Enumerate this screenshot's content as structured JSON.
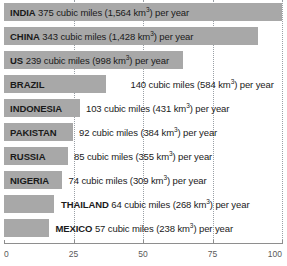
{
  "chart_data": {
    "type": "bar",
    "orientation": "horizontal",
    "title": "",
    "xlabel": "",
    "ylabel": "",
    "xlim": [
      0,
      100
    ],
    "grid": "vertical-dotted",
    "legend": "none",
    "xticks": [
      "0",
      "25",
      "50",
      "75",
      "100"
    ],
    "xtick_values": [
      0,
      25,
      50,
      75,
      100
    ],
    "categories": [
      "INDIA",
      "CHINA",
      "US",
      "BRAZIL",
      "INDONESIA",
      "PAKISTAN",
      "RUSSIA",
      "NIGERIA",
      "THAILAND",
      "MEXICO"
    ],
    "values": [
      375,
      343,
      239,
      140,
      103,
      92,
      85,
      74,
      64,
      57
    ],
    "values_km3": [
      1564,
      1428,
      998,
      584,
      431,
      384,
      309,
      355,
      268,
      238
    ],
    "unit": "cubic miles per year",
    "bar_color": "#a8a8a8",
    "bar_lengths_pct": [
      100,
      91.4,
      64.5,
      36.8,
      27.3,
      24.8,
      23.0,
      20.9,
      18.0,
      16.2
    ],
    "rows": [
      {
        "country": "INDIA",
        "value": "375",
        "middle": " cubic miles (1,564 km",
        "sup": "3",
        "tail": ") per year",
        "bar_pct": 100,
        "label_position": "inside",
        "value_position": "inside",
        "text_offset_pct": 2.2
      },
      {
        "country": "CHINA",
        "value": "343",
        "middle": " cubic miles (1,428 km",
        "sup": "3",
        "tail": ") per year",
        "bar_pct": 91.4,
        "label_position": "inside",
        "value_position": "inside",
        "text_offset_pct": 2.2
      },
      {
        "country": "US",
        "value": "239",
        "middle": " cubic miles (998 km",
        "sup": "3",
        "tail": ") per year",
        "bar_pct": 64.5,
        "label_position": "inside",
        "value_position": "inside",
        "text_offset_pct": 2.2
      },
      {
        "country": "BRAZIL",
        "value": "140",
        "middle": " cubic miles (584 km",
        "sup": "3",
        "tail": ") per year",
        "bar_pct": 36.8,
        "label_position": "inside",
        "value_position": "outside",
        "text_offset_pct": 2.2,
        "value_offset_pct": 45.5
      },
      {
        "country": "INDONESIA",
        "value": "103",
        "middle": " cubic miles (431 km",
        "sup": "3",
        "tail": ") per year",
        "bar_pct": 27.3,
        "label_position": "inside",
        "value_position": "outside",
        "text_offset_pct": 2.2,
        "value_offset_pct": 29.5
      },
      {
        "country": "PAKISTAN",
        "value": "92",
        "middle": " cubic miles (384 km",
        "sup": "3",
        "tail": ") per year",
        "bar_pct": 24.8,
        "label_position": "inside",
        "value_position": "outside",
        "text_offset_pct": 2.2,
        "value_offset_pct": 27.0
      },
      {
        "country": "RUSSIA",
        "value": "85",
        "middle": " cubic miles (355 km",
        "sup": "3",
        "tail": ") per year",
        "bar_pct": 23.0,
        "label_position": "inside",
        "value_position": "outside",
        "text_offset_pct": 2.2,
        "value_offset_pct": 25.2
      },
      {
        "country": "NIGERIA",
        "value": "74",
        "middle": " cubic miles (309 km",
        "sup": "3",
        "tail": ") per year",
        "bar_pct": 20.9,
        "label_position": "inside",
        "value_position": "outside",
        "text_offset_pct": 2.2,
        "value_offset_pct": 23.2
      },
      {
        "country": "THAILAND",
        "value": "64",
        "middle": " cubic miles (268 km",
        "sup": "3",
        "tail": ") per year",
        "bar_pct": 18.0,
        "label_position": "outside",
        "value_position": "outside",
        "text_offset_pct": 20.5
      },
      {
        "country": "MEXICO",
        "value": "57",
        "middle": " cubic miles (238 km",
        "sup": "3",
        "tail": ") per year",
        "bar_pct": 16.2,
        "label_position": "outside",
        "value_position": "outside",
        "text_offset_pct": 18.5
      }
    ]
  }
}
